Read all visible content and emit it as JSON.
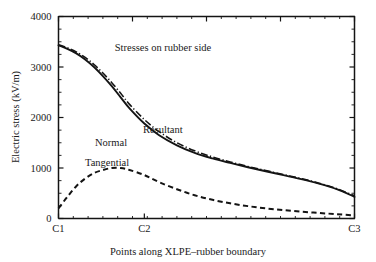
{
  "chart_data": {
    "type": "line",
    "title": "",
    "annotation": "Stresses on rubber side",
    "xlabel": "Points along XLPE–rubber boundary",
    "ylabel": "Electric stress (kV/m)",
    "xlim": [
      0,
      1
    ],
    "ylim": [
      0,
      4000
    ],
    "grid": false,
    "legend_position": "inline-labels",
    "x_tick_labels": [
      "C1",
      "C2",
      "C3"
    ],
    "x_tick_positions": [
      0,
      0.29,
      1
    ],
    "y_tick_labels": [
      "0",
      "1000",
      "2000",
      "3000",
      "4000"
    ],
    "y_tick_values": [
      0,
      1000,
      2000,
      3000,
      4000
    ],
    "y_minor_tick_step": 250,
    "x": [
      0,
      0.03,
      0.06,
      0.09,
      0.12,
      0.15,
      0.18,
      0.21,
      0.24,
      0.29,
      0.34,
      0.4,
      0.46,
      0.52,
      0.58,
      0.64,
      0.7,
      0.76,
      0.82,
      0.88,
      0.94,
      1.0
    ],
    "series": [
      {
        "name": "Resultant",
        "style": "dash-dot",
        "label_x": 0.29,
        "label_y": 1980,
        "values": [
          3440,
          3380,
          3300,
          3190,
          3050,
          2880,
          2690,
          2480,
          2260,
          1960,
          1720,
          1500,
          1340,
          1220,
          1120,
          1030,
          950,
          870,
          790,
          700,
          590,
          450
        ]
      },
      {
        "name": "Normal",
        "style": "solid",
        "label_x": 0.135,
        "label_y": 1680,
        "values": [
          3430,
          3360,
          3270,
          3150,
          3000,
          2820,
          2620,
          2400,
          2180,
          1880,
          1650,
          1450,
          1300,
          1190,
          1100,
          1015,
          935,
          860,
          780,
          690,
          580,
          430
        ]
      },
      {
        "name": "Tangential",
        "style": "dashed",
        "label_x": 0.1,
        "label_y": 1280,
        "values": [
          200,
          430,
          640,
          790,
          900,
          960,
          1000,
          1000,
          960,
          860,
          720,
          580,
          460,
          370,
          300,
          245,
          200,
          165,
          135,
          110,
          85,
          60
        ]
      }
    ]
  },
  "figure": {
    "background_color": "#ffffff",
    "ink_color": "#141414"
  }
}
